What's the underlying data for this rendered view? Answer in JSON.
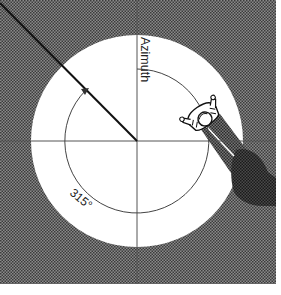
{
  "diagram": {
    "title_label": "Azimuth",
    "angle_label": "315°",
    "angle_degrees": 315,
    "colors": {
      "background_texture": "#6e6e6e",
      "circle_fill": "#ffffff",
      "axis_line": "#555555",
      "direction_line": "#111111",
      "shadow_band": "#5a5a5a",
      "shadow_blob": "#2e2e2e",
      "figure_outline": "#111111"
    }
  }
}
